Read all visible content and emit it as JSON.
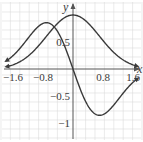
{
  "chart_data": {
    "type": "line",
    "title": "",
    "xlabel": "x",
    "ylabel": "y",
    "xlim": [
      -1.9,
      1.75
    ],
    "ylim": [
      -1.3,
      1.25
    ],
    "grid": true,
    "x_ticks": [
      -1.6,
      -0.8,
      0.8,
      1.6
    ],
    "x_tick_labels": [
      "−1.6",
      "−0.8",
      "0.8",
      "1.6"
    ],
    "y_ticks": [
      0.5,
      -0.5,
      -1
    ],
    "y_tick_labels": [
      "0.5",
      "−0.5",
      "−1"
    ],
    "series": [
      {
        "name": "f(x) = e^(-x^2)",
        "x": [
          -1.9,
          -1.6,
          -1.2,
          -0.8,
          -0.4,
          0,
          0.4,
          0.8,
          1.2,
          1.6,
          1.75
        ],
        "values": [
          0.03,
          0.08,
          0.24,
          0.53,
          0.85,
          1.0,
          0.85,
          0.53,
          0.24,
          0.08,
          0.05
        ]
      },
      {
        "name": "f'(x) = -2x e^(-x^2)",
        "x": [
          -1.9,
          -1.6,
          -1.2,
          -0.71,
          -0.4,
          0,
          0.4,
          0.71,
          1.2,
          1.6,
          1.75
        ],
        "values": [
          0.1,
          0.25,
          0.57,
          0.86,
          0.68,
          0,
          -0.68,
          -0.86,
          -0.57,
          -0.25,
          -0.16
        ]
      }
    ],
    "colors": {
      "curve": "#3a3a3a",
      "axis": "#555555",
      "grid": "#dcdcdc"
    }
  }
}
